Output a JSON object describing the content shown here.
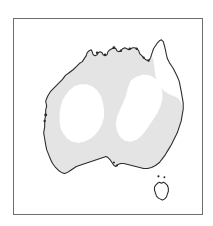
{
  "figure": {
    "kind": "distribution-map",
    "region": "Australia",
    "frame": {
      "border_color": "#6e6e6e",
      "background_color": "#ffffff",
      "x": 13,
      "y": 18,
      "width": 190,
      "height": 197
    }
  },
  "map": {
    "landmass_name": "Australia",
    "coastline_color": "#2b2b2b",
    "land_fill_color": "#ffffff",
    "range_fill_color": "#e4e4e4",
    "viewbox": "0 0 190 197",
    "mainland": {
      "name": "australian-mainland",
      "outline_path": "M 34 84 L 33 80 L 38 73 L 43 68 L 48 63 L 53 58 L 58 53 L 63 49 L 68 45 L 72 41 L 76 37 L 80 34 L 83 32 L 86 33 L 88 36 L 90 39 L 93 38 L 96 35 L 99 33 L 101 31 L 104 30 L 106 32 L 109 31 L 112 29 L 115 28 L 118 27 L 121 27 L 124 28 L 126 30 L 128 33 L 130 36 L 132 39 L 134 41 L 137 42 L 139 40 L 141 37 L 143 34 L 145 31 L 147 28 L 149 25 L 151 23 L 153 25 L 154 29 L 155 34 L 156 39 L 158 43 L 160 46 L 162 49 L 164 53 L 166 57 L 168 62 L 169 67 L 170 72 L 171 78 L 172 84 L 172 90 L 171 96 L 170 102 L 168 108 L 166 114 L 164 120 L 161 126 L 158 131 L 155 136 L 152 140 L 149 144 L 146 147 L 142 149 L 138 150 L 134 150 L 130 149 L 126 148 L 122 147 L 118 146 L 114 145 L 110 145 L 107 146 L 104 147 L 101 146 L 99 144 L 97 141 L 95 139 L 92 138 L 89 139 L 86 140 L 83 141 L 80 142 L 77 143 L 74 144 L 71 145 L 68 146 L 65 147 L 62 148 L 59 150 L 56 152 L 53 154 L 50 155 L 47 154 L 44 152 L 41 149 L 38 145 L 36 141 L 34 136 L 33 131 L 32 126 L 31 120 L 31 114 L 32 108 L 32 102 L 33 96 L 33 90 Z",
      "detailed_coast_path": "M 33 88 L 32 83 L 34 78 L 37 73 L 41 69 L 45 65 L 49 61 L 52 57 L 56 54 L 60 51 L 63 48 L 66 45 L 69 43 L 71 40 L 73 37 L 74 34 L 76 32 L 78 31 L 79 33 L 80 36 L 82 37 L 84 36 L 85 34 L 87 33 L 89 34 L 90 36 L 92 37 L 94 36 L 95 33 L 97 31 L 99 30 L 101 29 L 103 30 L 104 32 L 106 33 L 108 32 L 110 30 L 112 29 L 114 30 L 116 31 L 118 30 L 120 29 L 122 29 L 124 30 L 126 32 L 127 35 L 129 37 L 131 39 L 133 41 L 135 42 L 137 41 L 138 39 L 139 36 L 140 33 L 141 30 L 143 27 L 145 24 L 147 22 L 149 21 L 151 23 L 152 27 L 153 31 L 154 36 L 155 40 L 157 44 L 159 47 L 161 50 L 163 54 L 165 58 L 167 63 L 168 68 L 169 73 L 170 79 L 171 85 L 171 91 L 170 97 L 169 103 L 167 109 L 165 115 L 162 121 L 159 127 L 156 132 L 153 137 L 150 141 L 147 145 L 143 148 L 139 150 L 135 151 L 131 151 L 127 150 L 123 149 L 119 148 L 115 147 L 111 146 L 108 146 L 105 147 L 103 149 L 101 148 L 99 145 L 97 142 L 95 140 L 93 139 L 90 140 L 87 141 L 84 142 L 81 143 L 78 144 L 75 145 L 72 146 L 69 147 L 66 148 L 63 149 L 60 151 L 57 153 L 54 155 L 51 156 L 48 155 L 45 153 L 42 150 L 39 146 L 37 142 L 35 137 L 33 132 L 32 127 L 31 121 L 30 115 L 31 109 L 31 103 L 32 97 L 32 92 Z"
    },
    "tasmania": {
      "name": "tasmania",
      "outline_path": "M 143 168 L 145 166 L 147 165 L 149 166 L 151 165 L 153 166 L 155 168 L 156 171 L 156 174 L 155 177 L 154 180 L 152 182 L 150 183 L 148 182 L 146 181 L 144 179 L 143 176 L 142 173 L 142 170 Z"
    },
    "distribution_range": {
      "name": "shaded-distribution-range",
      "description": "Gray shaded area indicating species range across most of mainland Australia, excluding two interior zones",
      "fill_color": "#e4e4e4",
      "outer_path": "M 33 88 L 32 83 L 34 78 L 37 73 L 41 69 L 45 65 L 49 61 L 52 57 L 56 54 L 60 51 L 63 48 L 66 45 L 69 43 L 71 40 L 73 37 L 74 34 L 76 32 L 78 31 L 79 33 L 80 36 L 82 37 L 84 36 L 85 34 L 87 33 L 89 34 L 90 36 L 92 37 L 94 36 L 95 33 L 97 31 L 99 30 L 101 29 L 103 30 L 104 32 L 106 33 L 108 32 L 110 30 L 112 29 L 114 30 L 116 31 L 118 30 L 120 29 L 122 29 L 124 30 L 126 32 L 127 35 L 129 37 L 131 39 L 133 41 L 135 42 L 137 41 L 138 39 L 139 36 L 141 42 L 142 50 L 143 58 L 145 64 L 148 69 L 152 73 L 157 76 L 162 78 L 166 80 L 169 84 L 170 90 L 170 97 L 169 103 L 167 109 L 165 115 L 162 121 L 159 127 L 156 132 L 153 137 L 150 141 L 147 145 L 143 148 L 139 150 L 135 151 L 131 151 L 127 150 L 123 149 L 119 148 L 115 147 L 111 146 L 108 146 L 105 147 L 103 149 L 101 148 L 99 145 L 97 142 L 95 140 L 93 139 L 90 140 L 87 141 L 84 142 L 81 143 L 78 144 L 75 145 L 72 146 L 69 147 L 66 148 L 63 149 L 60 151 L 57 153 L 54 155 L 51 156 L 48 155 L 45 153 L 42 150 L 39 146 L 37 142 L 35 137 L 33 132 L 32 127 L 31 121 L 30 115 L 31 109 L 31 103 L 32 97 L 32 92 Z",
      "hole_west_path": "M 56 72 L 61 68 L 67 66 L 73 66 L 79 68 L 84 72 L 88 78 L 90 85 L 91 92 L 91 99 L 89 106 L 86 112 L 82 117 L 77 121 L 71 124 L 65 125 L 59 124 L 54 121 L 50 116 L 47 110 L 46 103 L 46 96 L 47 89 L 49 82 L 52 77 Z",
      "hole_east_path": "M 118 62 L 124 58 L 131 56 L 138 57 L 144 61 L 148 67 L 150 74 L 150 81 L 148 88 L 145 95 L 141 101 L 137 107 L 133 113 L 129 118 L 124 122 L 118 124 L 112 123 L 107 119 L 104 113 L 103 106 L 104 99 L 107 92 L 110 85 L 113 78 L 115 70 Z",
      "hole_cape_york_path": "M 143 27 L 145 24 L 147 22 L 149 21 L 151 23 L 152 27 L 153 31 L 154 36 L 152 40 L 149 43 L 146 42 L 144 38 L 143 33 Z"
    },
    "coastal_islets": [
      {
        "name": "islet-north-1",
        "cx": 84,
        "cy": 34,
        "r": 1.3
      },
      {
        "name": "islet-north-2",
        "cx": 92,
        "cy": 36,
        "r": 1.2
      },
      {
        "name": "islet-north-3",
        "cx": 101,
        "cy": 29,
        "r": 1.4
      },
      {
        "name": "islet-north-4",
        "cx": 108,
        "cy": 32,
        "r": 1.2
      },
      {
        "name": "islet-north-5",
        "cx": 117,
        "cy": 30,
        "r": 1.3
      },
      {
        "name": "islet-north-6",
        "cx": 124,
        "cy": 30,
        "r": 1.2
      },
      {
        "name": "islet-north-7",
        "cx": 131,
        "cy": 39,
        "r": 1.1
      },
      {
        "name": "islet-north-8",
        "cx": 136,
        "cy": 42,
        "r": 1.2
      },
      {
        "name": "islet-west-1",
        "cx": 32,
        "cy": 97,
        "r": 1.5
      },
      {
        "name": "islet-west-2",
        "cx": 31,
        "cy": 103,
        "r": 1.2
      },
      {
        "name": "islet-south-1",
        "cx": 104,
        "cy": 148,
        "r": 1.1
      },
      {
        "name": "islet-south-2",
        "cx": 101,
        "cy": 145,
        "r": 1.0
      },
      {
        "name": "islet-bass-1",
        "cx": 146,
        "cy": 159,
        "r": 1.1
      },
      {
        "name": "islet-bass-2",
        "cx": 152,
        "cy": 160,
        "r": 1.0
      }
    ]
  }
}
